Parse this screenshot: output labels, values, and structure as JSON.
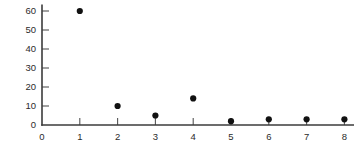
{
  "chart_data": {
    "type": "scatter",
    "title": "",
    "subtitle": "",
    "xlabel": "",
    "ylabel": "",
    "x": [
      1,
      2,
      3,
      4,
      5,
      6,
      7,
      8
    ],
    "values": [
      60,
      10,
      5,
      14,
      2,
      3,
      3,
      3
    ],
    "series": [
      {
        "name": "series-1",
        "x": [
          1,
          2,
          3,
          4,
          5,
          6,
          7,
          8
        ],
        "values": [
          60,
          10,
          5,
          14,
          2,
          3,
          3,
          3
        ]
      }
    ],
    "points": [
      {
        "x": 1,
        "y": 60
      },
      {
        "x": 2,
        "y": 10
      },
      {
        "x": 3,
        "y": 5
      },
      {
        "x": 4,
        "y": 14
      },
      {
        "x": 5,
        "y": 2
      },
      {
        "x": 6,
        "y": 3
      },
      {
        "x": 7,
        "y": 3
      },
      {
        "x": 8,
        "y": 3
      }
    ],
    "xlim": [
      0,
      8.35
    ],
    "ylim": [
      0,
      63
    ],
    "xticks": [
      0,
      1,
      2,
      3,
      4,
      5,
      6,
      7,
      8
    ],
    "yticks": [
      0,
      10,
      20,
      30,
      40,
      50,
      60
    ],
    "xtick_labels": [
      "0",
      "1",
      "2",
      "3",
      "4",
      "5",
      "6",
      "7",
      "8"
    ],
    "ytick_labels": [
      "0",
      "10",
      "20",
      "30",
      "40",
      "50",
      "60"
    ],
    "grid": false,
    "legend": false,
    "legend_position": "none",
    "marker": "filled-circle",
    "marker_color": "#111111",
    "axis_color": "#3b3b3b",
    "background_color": "#ffffff"
  }
}
